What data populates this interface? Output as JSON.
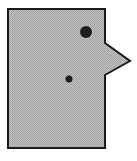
{
  "figure": {
    "shape": "speech-bubble-rectangle-with-right-pointer",
    "fill_color": "#b4b4b4",
    "stroke_color": "#1a1a1a",
    "dot_color": "#1e1e1e",
    "dots": [
      {
        "name": "large-dot",
        "cx": 86,
        "cy": 32,
        "r": 6
      },
      {
        "name": "small-dot",
        "cx": 69,
        "cy": 79,
        "r": 3.5
      }
    ]
  }
}
